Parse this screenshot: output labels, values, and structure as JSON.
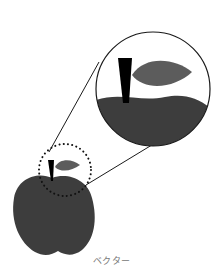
{
  "caption": "ベクター",
  "colors": {
    "apple": "#3d3d3d",
    "leaf": "#5c5c5c",
    "stem": "#000000",
    "outline": "#1a1a1a",
    "caption": "#777777",
    "background": "#ffffff"
  },
  "illustration": {
    "subject": "apple",
    "magnified_region": "stem-and-leaf",
    "selection_style": "dotted-circle"
  }
}
